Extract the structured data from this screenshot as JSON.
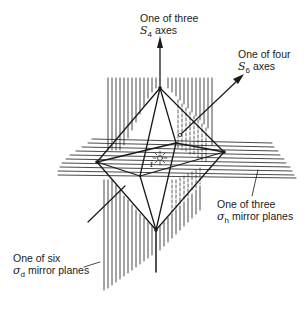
{
  "figure": {
    "type": "octahedron symmetry elements diagram",
    "stroke_color": "#1a1a1a",
    "background": "#ffffff"
  },
  "labels": {
    "s4_axis": {
      "line1": "One of three",
      "symbol": "S",
      "subscript": "4",
      "suffix": " axes"
    },
    "s6_axis": {
      "line1": "One of four",
      "symbol": "S",
      "subscript": "6",
      "suffix": " axes"
    },
    "sigma_h": {
      "line1": "One of three",
      "symbol": "σ",
      "subscript": "h",
      "suffix": " mirror planes"
    },
    "sigma_d": {
      "line1": "One of six",
      "symbol": "σ",
      "subscript": "d",
      "suffix": " mirror planes"
    },
    "inversion_center": {
      "symbol": "i"
    }
  },
  "icons": {
    "inversion_center": "sunburst-icon",
    "s4_arrow": "arrow-up-icon",
    "s6_arrow": "arrow-up-right-icon"
  }
}
